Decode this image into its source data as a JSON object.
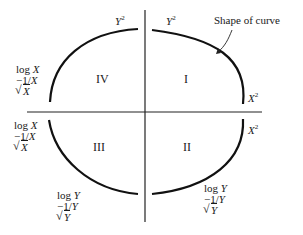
{
  "diagram": {
    "annotation": "Shape of curve",
    "quadrants": [
      {
        "id": "IV",
        "label": "IV"
      },
      {
        "id": "I",
        "label": "I"
      },
      {
        "id": "III",
        "label": "III"
      },
      {
        "id": "II",
        "label": "II"
      }
    ],
    "labels": {
      "top_left_y": {
        "var": "Y",
        "exp": "2"
      },
      "top_right_y": {
        "var": "Y",
        "exp": "2"
      },
      "right_top_x": {
        "var": "X",
        "exp": "2"
      },
      "right_bottom_x": {
        "var": "X",
        "exp": "2"
      },
      "left_upper": {
        "line1_fn": "log",
        "line1_var": "X",
        "line2": "−1/",
        "line2_var": "X",
        "line3_var": "X"
      },
      "left_lower": {
        "line1_fn": "log",
        "line1_var": "X",
        "line2": "−1/",
        "line2_var": "X",
        "line3_var": "X"
      },
      "bottom_left": {
        "line1_fn": "log",
        "line1_var": "Y",
        "line2": "−1/",
        "line2_var": "Y",
        "line3_var": "Y"
      },
      "bottom_right": {
        "line1_fn": "log",
        "line1_var": "Y",
        "line2": "−1/",
        "line2_var": "Y",
        "line3_var": "Y"
      }
    }
  }
}
